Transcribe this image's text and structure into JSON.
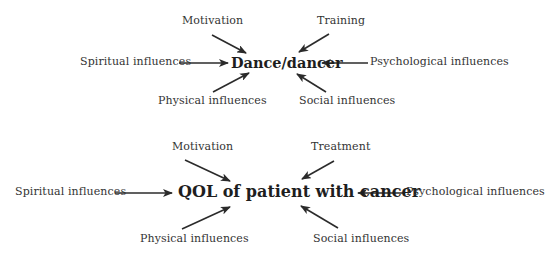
{
  "diagrams": [
    {
      "center": "Dance/dancer",
      "labels": {
        "top_left": "Motivation",
        "top_right": "Training",
        "left": "Spiritual influences",
        "right": "Psychological influences",
        "bottom_left": "Physical influences",
        "bottom_right": "Social influences"
      }
    },
    {
      "center": "QOL of patient with cancer",
      "labels": {
        "top_left": "Motivation",
        "top_right": "Treatment",
        "left": "Spiritual influences",
        "right": "Psychological influences",
        "bottom_left": "Physical influences",
        "bottom_right": "Social influences"
      }
    }
  ],
  "colors": {
    "arrow": "#2b2b2b",
    "text": "#333333",
    "background": "#ffffff"
  }
}
